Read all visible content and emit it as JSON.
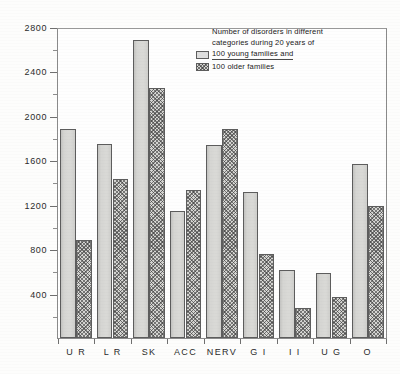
{
  "chart_data": {
    "type": "bar",
    "title": "",
    "xlabel": "",
    "ylabel": "",
    "ylim": [
      0,
      2800
    ],
    "grid": false,
    "legend_position": "top-right",
    "categories": [
      "U R",
      "L R",
      "SK",
      "ACC",
      "NERV",
      "G I",
      "I I",
      "U G",
      "O"
    ],
    "y_ticks_major": [
      400,
      800,
      1200,
      1600,
      2000,
      2400,
      2800
    ],
    "y_ticks_minor": [
      200,
      600,
      1000,
      1400,
      1800,
      2200,
      2600
    ],
    "series": [
      {
        "name": "100 young families",
        "fill": "plain",
        "values": [
          1890,
          1760,
          2700,
          1150,
          1750,
          1320,
          620,
          590,
          1580
        ]
      },
      {
        "name": "100 older families",
        "fill": "hatched",
        "values": [
          890,
          1440,
          2270,
          1340,
          1890,
          760,
          270,
          370,
          1200
        ]
      }
    ],
    "annotations": {
      "legend_title_line1": "Number of disorders in different",
      "legend_title_line2": "categories during 20 years of"
    }
  },
  "legend": {
    "title": "Number of disorders in different\ncategories during 20 years of",
    "entries": [
      {
        "label": "100 young  families  and",
        "swatch": "plain-swatch"
      },
      {
        "label": "100 older   families",
        "swatch": "hatched-swatch"
      }
    ]
  },
  "axis": {
    "y_labels": [
      "2800",
      "2400",
      "2000",
      "1600",
      "1200",
      "800",
      "400"
    ],
    "x_labels": [
      "U R",
      "L R",
      "SK",
      "ACC",
      "NERV",
      "G I",
      "I I",
      "U G",
      "O"
    ]
  },
  "colors": {
    "plain_fill": "#d9d9d6",
    "hatch_fill": "#d5d5d2",
    "bar_border": "#5d5d5d",
    "axis": "#8a8a8a",
    "text": "#2b2b2b",
    "background": "#fdfdfc"
  }
}
